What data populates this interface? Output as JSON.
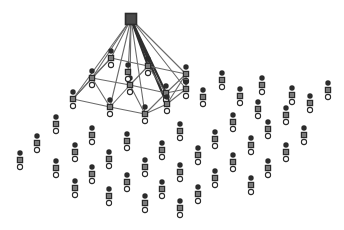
{
  "figure": {
    "title": "",
    "background_color": "#ffffff",
    "width": 344,
    "height": 230
  },
  "style": {
    "edge_color": "#6a6a6a",
    "edge_color_dark": "#2f2f2f",
    "edge_width": 1.1,
    "edge_width_dark": 2.2,
    "node_circle_fill": "#2b2b2b",
    "node_square_fill": "#7a7a7a",
    "node_square_stroke": "#2b2b2b",
    "node_open_circle_fill": "#ffffff",
    "node_open_circle_stroke": "#2b2b2b",
    "root_square_fill": "#4a4a4a",
    "root_square_stroke": "#2b2b2b",
    "glyph_circle_radius": 2.7,
    "glyph_square_size": 5.2,
    "glyph_open_radius": 2.6,
    "glyph_offset_circle_y": -7,
    "glyph_offset_square_y": 0,
    "glyph_offset_open_y": 7
  },
  "chart_data": {
    "type": "scatter",
    "title": "",
    "xlabel": "",
    "ylabel": "",
    "xlim": [
      0,
      344
    ],
    "ylim": [
      0,
      230
    ],
    "grid": false,
    "legend": [],
    "node_glyph": [
      "filled-circle",
      "gray-square",
      "open-circle"
    ],
    "root": {
      "id": "r0",
      "x": 131,
      "y": 19,
      "kind": "root-square",
      "size": 11
    },
    "cluster_nodes": [
      {
        "id": "c0",
        "x": 111,
        "y": 58
      },
      {
        "id": "c1",
        "x": 148,
        "y": 66
      },
      {
        "id": "c2",
        "x": 92,
        "y": 78
      },
      {
        "id": "c3",
        "x": 130,
        "y": 85
      },
      {
        "id": "c4",
        "x": 186,
        "y": 74
      },
      {
        "id": "c5",
        "x": 166,
        "y": 93
      },
      {
        "id": "c6",
        "x": 73,
        "y": 99
      },
      {
        "id": "c7",
        "x": 110,
        "y": 107
      },
      {
        "id": "c8",
        "x": 145,
        "y": 114
      },
      {
        "id": "c9",
        "x": 167,
        "y": 104
      },
      {
        "id": "c10",
        "x": 186,
        "y": 89
      },
      {
        "id": "c11",
        "x": 128,
        "y": 72
      }
    ],
    "cluster_edges": [
      [
        "r0",
        "c0"
      ],
      [
        "r0",
        "c1"
      ],
      [
        "r0",
        "c2"
      ],
      [
        "r0",
        "c3"
      ],
      [
        "r0",
        "c4"
      ],
      [
        "r0",
        "c5"
      ],
      [
        "r0",
        "c6"
      ],
      [
        "r0",
        "c7"
      ],
      [
        "r0",
        "c8"
      ],
      [
        "r0",
        "c9"
      ],
      [
        "r0",
        "c10"
      ],
      [
        "r0",
        "c11"
      ],
      [
        "c0",
        "c1"
      ],
      [
        "c0",
        "c2"
      ],
      [
        "c1",
        "c4"
      ],
      [
        "c1",
        "c3"
      ],
      [
        "c2",
        "c6"
      ],
      [
        "c2",
        "c3"
      ],
      [
        "c3",
        "c5"
      ],
      [
        "c4",
        "c10"
      ],
      [
        "c4",
        "c5"
      ],
      [
        "c5",
        "c9"
      ],
      [
        "c6",
        "c7"
      ],
      [
        "c7",
        "c8"
      ],
      [
        "c8",
        "c9"
      ],
      [
        "c9",
        "c10"
      ],
      [
        "c10",
        "c5"
      ],
      [
        "c6",
        "c2"
      ],
      [
        "c2",
        "c7"
      ],
      [
        "c3",
        "c8"
      ],
      [
        "c1",
        "c5"
      ],
      [
        "c0",
        "c6"
      ],
      [
        "c4",
        "c9"
      ],
      [
        "c7",
        "c3"
      ],
      [
        "c8",
        "c5"
      ]
    ],
    "scatter_nodes": [
      {
        "id": "s0",
        "x": 20,
        "y": 160
      },
      {
        "id": "s1",
        "x": 37,
        "y": 143
      },
      {
        "id": "s2",
        "x": 56,
        "y": 124
      },
      {
        "id": "s3",
        "x": 56,
        "y": 168
      },
      {
        "id": "s4",
        "x": 75,
        "y": 152
      },
      {
        "id": "s5",
        "x": 75,
        "y": 188
      },
      {
        "id": "s6",
        "x": 92,
        "y": 135
      },
      {
        "id": "s7",
        "x": 92,
        "y": 174
      },
      {
        "id": "s8",
        "x": 109,
        "y": 159
      },
      {
        "id": "s9",
        "x": 109,
        "y": 196
      },
      {
        "id": "s10",
        "x": 127,
        "y": 141
      },
      {
        "id": "s11",
        "x": 127,
        "y": 182
      },
      {
        "id": "s12",
        "x": 145,
        "y": 167
      },
      {
        "id": "s13",
        "x": 145,
        "y": 203
      },
      {
        "id": "s14",
        "x": 162,
        "y": 150
      },
      {
        "id": "s15",
        "x": 162,
        "y": 189
      },
      {
        "id": "s16",
        "x": 180,
        "y": 131
      },
      {
        "id": "s17",
        "x": 180,
        "y": 172
      },
      {
        "id": "s18",
        "x": 180,
        "y": 208
      },
      {
        "id": "s19",
        "x": 198,
        "y": 155
      },
      {
        "id": "s20",
        "x": 198,
        "y": 194
      },
      {
        "id": "s21",
        "x": 203,
        "y": 97
      },
      {
        "id": "s22",
        "x": 215,
        "y": 139
      },
      {
        "id": "s23",
        "x": 215,
        "y": 178
      },
      {
        "id": "s24",
        "x": 222,
        "y": 80
      },
      {
        "id": "s25",
        "x": 233,
        "y": 122
      },
      {
        "id": "s26",
        "x": 233,
        "y": 162
      },
      {
        "id": "s27",
        "x": 240,
        "y": 96
      },
      {
        "id": "s28",
        "x": 251,
        "y": 145
      },
      {
        "id": "s29",
        "x": 251,
        "y": 185
      },
      {
        "id": "s30",
        "x": 258,
        "y": 109
      },
      {
        "id": "s31",
        "x": 268,
        "y": 129
      },
      {
        "id": "s32",
        "x": 268,
        "y": 168
      },
      {
        "id": "s33",
        "x": 262,
        "y": 85
      },
      {
        "id": "s34",
        "x": 286,
        "y": 115
      },
      {
        "id": "s35",
        "x": 286,
        "y": 152
      },
      {
        "id": "s36",
        "x": 292,
        "y": 95
      },
      {
        "id": "s37",
        "x": 304,
        "y": 135
      },
      {
        "id": "s38",
        "x": 310,
        "y": 103
      },
      {
        "id": "s39",
        "x": 328,
        "y": 90
      }
    ]
  }
}
